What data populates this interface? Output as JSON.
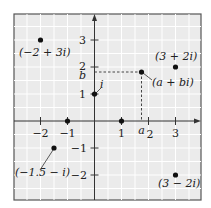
{
  "diagram": {
    "colors": {
      "background": "#ebebeb",
      "grid": "#ffffff",
      "frame": "#555555",
      "axis": "#333333",
      "point": "#111111",
      "dashed": "#333333"
    },
    "x_axis": {
      "ticks": [
        {
          "value": -2,
          "label": "−2"
        },
        {
          "value": -1,
          "label": "−1"
        },
        {
          "value": 1,
          "label": "1"
        },
        {
          "value": 2,
          "label": "2"
        },
        {
          "value": 3,
          "label": "3"
        }
      ],
      "special_label": "a"
    },
    "y_axis": {
      "ticks": [
        {
          "value": 3,
          "label": "3"
        },
        {
          "value": 2,
          "label": "2"
        },
        {
          "value": 1,
          "label": "1"
        },
        {
          "value": -1,
          "label": "−1"
        },
        {
          "value": -2,
          "label": "−2"
        }
      ],
      "special_label": "b"
    },
    "points": [
      {
        "label": "(−2 + 3i)",
        "re": -2,
        "im": 3
      },
      {
        "label": "(3 + 2i)",
        "re": 3,
        "im": 2
      },
      {
        "label": "(a + bi)",
        "re": 1.75,
        "im": 1.8
      },
      {
        "label": "i",
        "re": 0,
        "im": 1
      },
      {
        "label": "",
        "re": 1,
        "im": 0
      },
      {
        "label": "",
        "re": -1,
        "im": 0
      },
      {
        "label": "(−1.5 − i)",
        "re": -1.5,
        "im": -1
      },
      {
        "label": "(3 − 2i)",
        "re": 3,
        "im": -2
      }
    ]
  }
}
